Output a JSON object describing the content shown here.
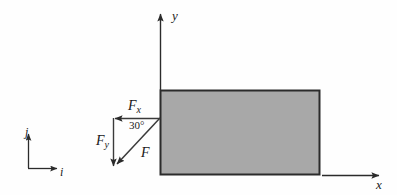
{
  "figure": {
    "type": "free-body-diagram",
    "background_color": "#fefefe",
    "stroke_color": "#2b2b2b",
    "body": {
      "name": "rectangular-block",
      "fill_color": "#a8a8a8",
      "border_color": "#2b2b2b",
      "x": 160,
      "y": 90,
      "width": 160,
      "height": 85
    },
    "axes": {
      "x": {
        "label": "x",
        "direction": "right",
        "start_x": 320,
        "end_x": 381,
        "y": 175
      },
      "y": {
        "label": "y",
        "direction": "up",
        "x": 160,
        "start_y": 90,
        "end_y": 12
      }
    },
    "basis": {
      "name": "unit-vector-frame",
      "origin_x": 28,
      "origin_y": 168,
      "i": {
        "label": "i",
        "direction": "right",
        "length": 33
      },
      "j": {
        "label": "j",
        "direction": "up",
        "length": 38
      }
    },
    "force": {
      "label": "F",
      "angle_label": "30°",
      "angle_degrees": 30,
      "direction": "down-left",
      "application_point_x": 160,
      "application_point_y": 118,
      "tip_x": 113,
      "tip_y": 168,
      "components": [
        {
          "name": "horizontal-component",
          "label_base": "F",
          "label_sub": "x",
          "direction": "left",
          "from_x": 160,
          "from_y": 118,
          "to_x": 113,
          "to_y": 118
        },
        {
          "name": "vertical-component",
          "label_base": "F",
          "label_sub": "y",
          "direction": "down",
          "from_x": 113,
          "from_y": 118,
          "to_x": 113,
          "to_y": 168
        }
      ]
    },
    "labels": {
      "axis_x": "x",
      "axis_y": "y",
      "basis_i": "i",
      "basis_j": "j",
      "force": "F",
      "force_x_base": "F",
      "force_x_sub": "x",
      "force_y_base": "F",
      "force_y_sub": "y",
      "angle": "30°"
    }
  }
}
